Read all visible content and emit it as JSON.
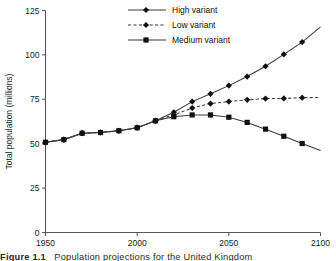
{
  "figure": {
    "caption_number": "Figure 1.1",
    "caption_text": "Population projections for the United Kingdom"
  },
  "axes": {
    "y_label": "Total population (millions)",
    "y_ticks": [
      0,
      25,
      50,
      75,
      100,
      125
    ],
    "x_ticks": [
      1950,
      2000,
      2050,
      2100
    ],
    "x_tick_labels": [
      "1950",
      "2000",
      "2050",
      "2100"
    ],
    "y_tick_labels": [
      "0",
      "25",
      "50",
      "75",
      "100",
      "125"
    ]
  },
  "legend": {
    "position": "top-center",
    "entries": [
      {
        "label": "High variant",
        "marker": "diamond",
        "style": "solid"
      },
      {
        "label": "Low variant",
        "marker": "diamond",
        "style": "dashed"
      },
      {
        "label": "Medium variant",
        "marker": "square",
        "style": "solid"
      }
    ]
  },
  "chart_data": {
    "type": "line",
    "title": "",
    "xlabel": "",
    "ylabel": "Total population (millions)",
    "xlim": [
      1950,
      2100
    ],
    "ylim": [
      0,
      125
    ],
    "grid": false,
    "legend_position": "top-center",
    "x": [
      1950,
      1960,
      1970,
      1980,
      1990,
      2000,
      2010,
      2020,
      2030,
      2040,
      2050,
      2060,
      2070,
      2080,
      2090,
      2100
    ],
    "series": [
      {
        "name": "High variant",
        "marker": "diamond",
        "style": "solid",
        "color": "#3a3a3a",
        "values": [
          50.8,
          52.3,
          55.9,
          56.3,
          57.3,
          59.0,
          62.9,
          67.7,
          73.7,
          78.1,
          82.7,
          87.8,
          93.6,
          100.3,
          107.2,
          115.8
        ]
      },
      {
        "name": "Low variant",
        "marker": "diamond",
        "style": "dashed",
        "color": "#3a3a3a",
        "values": [
          50.8,
          52.3,
          55.9,
          56.3,
          57.3,
          59.0,
          62.9,
          66.2,
          70.1,
          72.6,
          73.7,
          74.7,
          75.4,
          75.5,
          75.9,
          76.0
        ]
      },
      {
        "name": "Medium variant",
        "marker": "square",
        "style": "solid",
        "color": "#3a3a3a",
        "values": [
          50.8,
          52.3,
          55.9,
          56.3,
          57.3,
          59.0,
          62.9,
          65.2,
          66.2,
          66.2,
          64.9,
          62.0,
          58.2,
          54.2,
          50.1,
          46.2
        ]
      }
    ]
  }
}
